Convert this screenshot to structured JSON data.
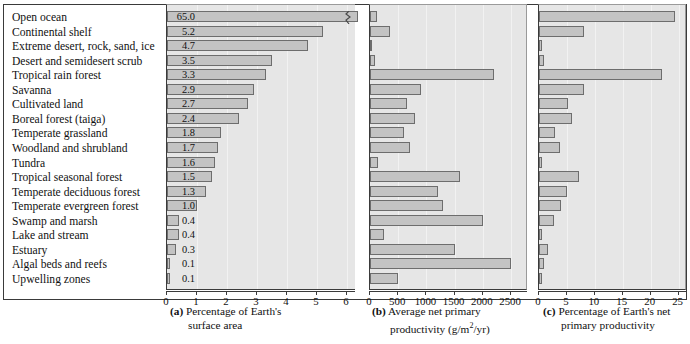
{
  "figure": {
    "ecosystems": [
      "Open ocean",
      "Continental shelf",
      "Extreme desert, rock, sand, ice",
      "Desert and semidesert scrub",
      "Tropical rain forest",
      "Savanna",
      "Cultivated land",
      "Boreal forest (taiga)",
      "Temperate grassland",
      "Woodland and shrubland",
      "Tundra",
      "Tropical seasonal forest",
      "Temperate deciduous forest",
      "Temperate evergreen forest",
      "Swamp and marsh",
      "Lake and stream",
      "Estuary",
      "Algal beds and reefs",
      "Upwelling zones"
    ],
    "captions": {
      "a_label": "(a)",
      "a_line1": "Percentage of Earth's",
      "a_line2": "surface area",
      "b_label": "(b)",
      "b_line1": "Average net primary",
      "b_line2_pre": "productivity (g/m",
      "b_line2_sup": "2",
      "b_line2_post": "/yr)",
      "c_label": "(c)",
      "c_line1": "Percentage of Earth's net",
      "c_line2": "primary productivity"
    },
    "colors": {
      "bar_fill": "#c3c3c3",
      "bar_stroke": "#6d6d6d",
      "plot_bg": "#e6e6e6",
      "frame": "#3a3a3a",
      "page_bg": "#ffffff"
    }
  },
  "chart_data": [
    {
      "type": "bar",
      "id": "a",
      "orientation": "horizontal",
      "title": "(a) Percentage of Earth's surface area",
      "xlabel": "Percentage of Earth's surface area",
      "ylabel": "",
      "xlim": [
        0,
        6.3
      ],
      "xticks": [
        0,
        1,
        2,
        3,
        4,
        5,
        6
      ],
      "axis_break": true,
      "axis_break_note": "Open ocean bar (65.0) is broken; axis truncated at 6",
      "grid": true,
      "data_labels": true,
      "categories": [
        "Open ocean",
        "Continental shelf",
        "Extreme desert, rock, sand, ice",
        "Desert and semidesert scrub",
        "Tropical rain forest",
        "Savanna",
        "Cultivated land",
        "Boreal forest (taiga)",
        "Temperate grassland",
        "Woodland and shrubland",
        "Tundra",
        "Tropical seasonal forest",
        "Temperate deciduous forest",
        "Temperate evergreen forest",
        "Swamp and marsh",
        "Lake and stream",
        "Estuary",
        "Algal beds and reefs",
        "Upwelling zones"
      ],
      "values": [
        65.0,
        5.2,
        4.7,
        3.5,
        3.3,
        2.9,
        2.7,
        2.4,
        1.8,
        1.7,
        1.6,
        1.5,
        1.3,
        1.0,
        0.4,
        0.4,
        0.3,
        0.1,
        0.1
      ],
      "value_labels": [
        "65.0",
        "5.2",
        "4.7",
        "3.5",
        "3.3",
        "2.9",
        "2.7",
        "2.4",
        "1.8",
        "1.7",
        "1.6",
        "1.5",
        "1.3",
        "1.0",
        "0.4",
        "0.4",
        "0.3",
        "0.1",
        "0.1"
      ]
    },
    {
      "type": "bar",
      "id": "b",
      "orientation": "horizontal",
      "title": "(b) Average net primary productivity (g/m2/yr)",
      "xlabel": "Average net primary productivity (g/m2/yr)",
      "ylabel": "",
      "xlim": [
        0,
        2800
      ],
      "xticks": [
        0,
        500,
        1000,
        1500,
        2000,
        2500
      ],
      "grid": true,
      "data_labels": false,
      "categories": [
        "Open ocean",
        "Continental shelf",
        "Extreme desert, rock, sand, ice",
        "Desert and semidesert scrub",
        "Tropical rain forest",
        "Savanna",
        "Cultivated land",
        "Boreal forest (taiga)",
        "Temperate grassland",
        "Woodland and shrubland",
        "Tundra",
        "Tropical seasonal forest",
        "Temperate deciduous forest",
        "Temperate evergreen forest",
        "Swamp and marsh",
        "Lake and stream",
        "Estuary",
        "Algal beds and reefs",
        "Upwelling zones"
      ],
      "values": [
        125,
        360,
        3,
        90,
        2200,
        900,
        650,
        800,
        600,
        700,
        140,
        1600,
        1200,
        1300,
        2000,
        250,
        1500,
        2500,
        500
      ]
    },
    {
      "type": "bar",
      "id": "c",
      "orientation": "horizontal",
      "title": "(c) Percentage of Earth's net primary productivity",
      "xlabel": "Percentage of Earth's net primary productivity",
      "ylabel": "",
      "xlim": [
        0,
        26.5
      ],
      "xticks": [
        0,
        5,
        10,
        15,
        20,
        25
      ],
      "grid": true,
      "data_labels": false,
      "categories": [
        "Open ocean",
        "Continental shelf",
        "Extreme desert, rock, sand, ice",
        "Desert and semidesert scrub",
        "Tropical rain forest",
        "Savanna",
        "Cultivated land",
        "Boreal forest (taiga)",
        "Temperate grassland",
        "Woodland and shrubland",
        "Tundra",
        "Tropical seasonal forest",
        "Temperate deciduous forest",
        "Temperate evergreen forest",
        "Swamp and marsh",
        "Lake and stream",
        "Estuary",
        "Algal beds and reefs",
        "Upwelling zones"
      ],
      "values": [
        24.4,
        8.0,
        0.6,
        0.9,
        22.0,
        8.0,
        5.2,
        5.9,
        2.8,
        3.8,
        0.6,
        7.2,
        5.1,
        4.0,
        2.7,
        0.6,
        1.7,
        0.9,
        0.5
      ]
    }
  ]
}
